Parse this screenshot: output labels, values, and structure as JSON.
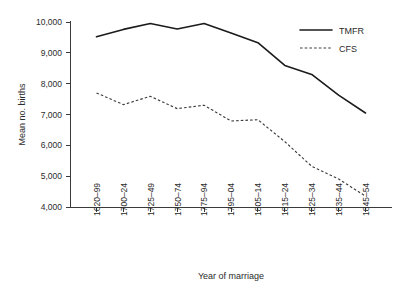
{
  "chart_data": {
    "type": "line",
    "title": "",
    "xlabel": "Year of marriage",
    "ylabel": "Mean no. births",
    "categories": [
      "1620–99",
      "1700–24",
      "1725–49",
      "1750–74",
      "1775–94",
      "1795–04",
      "1805–14",
      "1815–24",
      "1825–34",
      "1835–44",
      "1845–54"
    ],
    "series": [
      {
        "name": "TMFR",
        "style": "solid",
        "color": "#1b1b1b",
        "values": [
          9520,
          9760,
          9950,
          9770,
          9950,
          9640,
          9330,
          8590,
          8300,
          7630,
          7050
        ]
      },
      {
        "name": "CFS",
        "style": "dashed",
        "color": "#3d3d3d",
        "values": [
          7700,
          7320,
          7590,
          7190,
          7300,
          6790,
          6830,
          6120,
          5320,
          4910,
          4350
        ]
      }
    ],
    "ylim": [
      4000,
      10000
    ],
    "yticks": [
      4000,
      5000,
      6000,
      7000,
      8000,
      9000,
      10000
    ],
    "ytick_labels": [
      "4,000",
      "5,000",
      "6,000",
      "7,000",
      "8,000",
      "9,000",
      "10,000"
    ],
    "grid": false,
    "legend_position": "top-right",
    "legend": [
      {
        "label": "TMFR",
        "style": "solid"
      },
      {
        "label": "CFS",
        "style": "dashed"
      }
    ]
  }
}
